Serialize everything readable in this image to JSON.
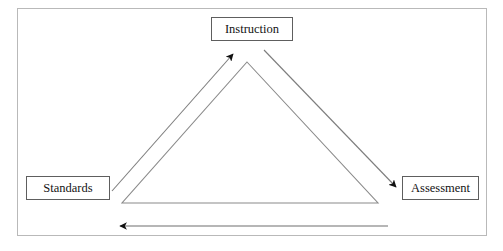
{
  "diagram": {
    "type": "triangle-cycle",
    "frame": {
      "border_color": "#b9b9b9",
      "background_color": "#ffffff"
    },
    "line_color": "#6b6b6b",
    "text_color": "#131313",
    "box_border_color": "#5e5e5e",
    "nodes": [
      {
        "id": "instruction",
        "label": "Instruction",
        "position": "top"
      },
      {
        "id": "standards",
        "label": "Standards",
        "position": "bottom-left"
      },
      {
        "id": "assessment",
        "label": "Assessment",
        "position": "bottom-right"
      }
    ],
    "connectors": [
      {
        "id": "standards-to-instruction",
        "from": "standards",
        "to": "instruction",
        "arrowhead": "end",
        "direction": "up-right"
      },
      {
        "id": "instruction-to-assessment",
        "from": "instruction",
        "to": "assessment",
        "arrowhead": "end",
        "direction": "down-right"
      },
      {
        "id": "assessment-to-standards",
        "from": "assessment",
        "to": "standards",
        "arrowhead": "end",
        "direction": "left"
      }
    ],
    "triangle": {
      "id": "inner-triangle",
      "apex": [
        247,
        62
      ],
      "bottom_left": [
        122,
        203
      ],
      "bottom_right": [
        378,
        203
      ]
    }
  }
}
